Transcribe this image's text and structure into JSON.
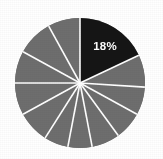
{
  "canvas": {
    "width": 163,
    "height": 159,
    "background_color": "#ffffff"
  },
  "chart_data": {
    "type": "pie",
    "title": "",
    "subtitle": "",
    "xlabel": "",
    "ylabel": "",
    "grid": false,
    "legend": "none",
    "center": {
      "x": 80,
      "y": 83
    },
    "radius": 65,
    "start_angle_deg": 0,
    "direction": "clockwise",
    "separator_color": "#ffffff",
    "separator_width_px": 1.6,
    "highlight_color": "#151515",
    "default_color": "#6e6e6e",
    "labels": [
      "18%"
    ],
    "annotations": [
      {
        "text": "18%",
        "slice_index": 0,
        "color": "#ffffff",
        "bold": true,
        "x": 105,
        "y": 47
      }
    ],
    "categories": [
      "Slice 1",
      "Slice 2",
      "Slice 3",
      "Slice 4",
      "Slice 5",
      "Slice 6",
      "Slice 7",
      "Slice 8",
      "Slice 9",
      "Slice 10",
      "Slice 11",
      "Slice 12"
    ],
    "values": [
      18,
      8,
      7,
      7,
      7,
      6,
      6,
      8,
      8,
      8,
      9,
      8
    ],
    "slices": [
      {
        "name": "Slice 1",
        "value": 18,
        "label": "18%",
        "color": "#151515",
        "highlighted": true,
        "start_deg": 0,
        "end_deg": 64.8
      },
      {
        "name": "Slice 2",
        "value": 8,
        "label": "",
        "color": "#6e6e6e",
        "highlighted": false,
        "start_deg": 64.8,
        "end_deg": 93.6
      },
      {
        "name": "Slice 3",
        "value": 7,
        "label": "",
        "color": "#6e6e6e",
        "highlighted": false,
        "start_deg": 93.6,
        "end_deg": 118.8
      },
      {
        "name": "Slice 4",
        "value": 7,
        "label": "",
        "color": "#6e6e6e",
        "highlighted": false,
        "start_deg": 118.8,
        "end_deg": 144.0
      },
      {
        "name": "Slice 5",
        "value": 7,
        "label": "",
        "color": "#6e6e6e",
        "highlighted": false,
        "start_deg": 144.0,
        "end_deg": 169.2
      },
      {
        "name": "Slice 6",
        "value": 6,
        "label": "",
        "color": "#6e6e6e",
        "highlighted": false,
        "start_deg": 169.2,
        "end_deg": 190.8
      },
      {
        "name": "Slice 7",
        "value": 6,
        "label": "",
        "color": "#6e6e6e",
        "highlighted": false,
        "start_deg": 190.8,
        "end_deg": 212.4
      },
      {
        "name": "Slice 8",
        "value": 8,
        "label": "",
        "color": "#6e6e6e",
        "highlighted": false,
        "start_deg": 212.4,
        "end_deg": 241.2
      },
      {
        "name": "Slice 9",
        "value": 8,
        "label": "",
        "color": "#6e6e6e",
        "highlighted": false,
        "start_deg": 241.2,
        "end_deg": 270.0
      },
      {
        "name": "Slice 10",
        "value": 8,
        "label": "",
        "color": "#6e6e6e",
        "highlighted": false,
        "start_deg": 270.0,
        "end_deg": 298.8
      },
      {
        "name": "Slice 11",
        "value": 9,
        "label": "",
        "color": "#6e6e6e",
        "highlighted": false,
        "start_deg": 298.8,
        "end_deg": 331.2
      },
      {
        "name": "Slice 12",
        "value": 8,
        "label": "",
        "color": "#6e6e6e",
        "highlighted": false,
        "start_deg": 331.2,
        "end_deg": 360.0
      }
    ]
  }
}
